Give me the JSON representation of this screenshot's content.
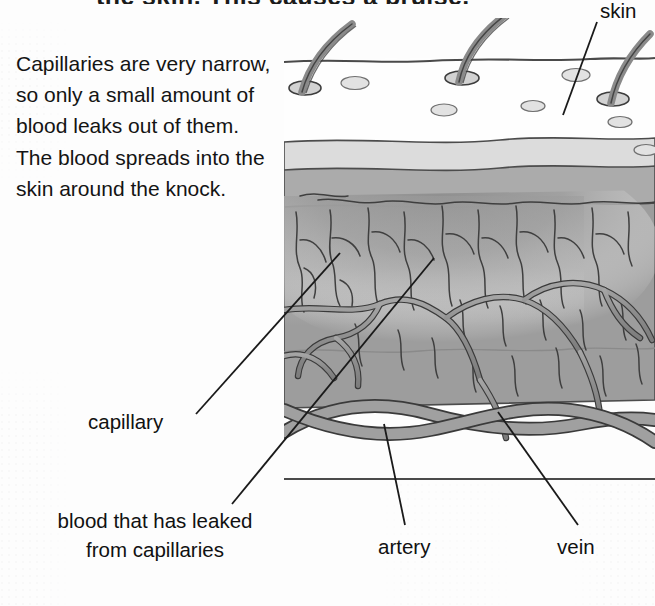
{
  "page": {
    "title_partial": "the skin. This causes a bruise.",
    "background_color": "#fdfdfd"
  },
  "body_text": {
    "paragraph": "Capillaries are very narrow, so only a small amount of blood leaks out of them. The blood spreads into the skin around the knock."
  },
  "labels": {
    "skin": "skin",
    "capillary": "capillary",
    "artery": "artery",
    "vein": "vein",
    "leaked_blood": "blood that has leaked from capillaries"
  },
  "diagram": {
    "name": "cross-section-of-skin-with-bruise",
    "layers": [
      {
        "name": "epidermis-surface",
        "color": "#ffffff"
      },
      {
        "name": "upper-dermis-light",
        "color": "#d9d9d9"
      },
      {
        "name": "mid-dermis",
        "color": "#adadad"
      },
      {
        "name": "lower-dermis",
        "color": "#9a9a9a"
      },
      {
        "name": "subcutaneous",
        "color": "#fbfbfb"
      }
    ],
    "features": {
      "hairs": 3,
      "pores": 6,
      "bruise_shading": "grey gradient spreading through dermis",
      "vessel_color": "#8e8e8e",
      "vessel_outline": "#3a3a3a",
      "capillary_line_color": "#4a4a4a"
    },
    "ink_color": "#3d3d3d"
  },
  "colors": {
    "ink": "#141414",
    "leader_line": "#1a1a1a",
    "skin_line": "#4a4a4a"
  }
}
